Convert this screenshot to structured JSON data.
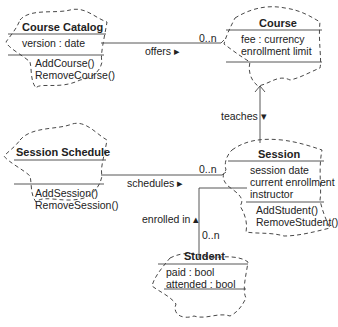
{
  "diagram": {
    "type": "UML class diagram",
    "classes": [
      {
        "name": "Course Catalog",
        "attributes": [
          "version : date"
        ],
        "operations": [
          "AddCourse()",
          "RemoveCourse()"
        ]
      },
      {
        "name": "Course",
        "attributes": [
          "fee : currency",
          "enrollment limit"
        ],
        "operations": []
      },
      {
        "name": "Session Schedule",
        "attributes": [],
        "operations": [
          "AddSession()",
          "RemoveSession()"
        ]
      },
      {
        "name": "Session",
        "attributes": [
          "session date",
          "current enrollment",
          "instructor"
        ],
        "operations": [
          "AddStudent()",
          "RemoveStudent()"
        ]
      },
      {
        "name": "Student",
        "attributes": [
          "paid : bool",
          "attended : bool"
        ],
        "operations": []
      }
    ],
    "associations": [
      {
        "from": "Course Catalog",
        "to": "Course",
        "label": "offers ▸",
        "multiplicity": "0..n"
      },
      {
        "from": "Session",
        "to": "Course",
        "label": "teaches ▾",
        "multiplicity": ""
      },
      {
        "from": "Session Schedule",
        "to": "Session",
        "label": "schedules ▸",
        "multiplicity": "0..n"
      },
      {
        "from": "Student",
        "to": "Session",
        "label": "enrolled in ▴",
        "multiplicity": "0..n"
      }
    ]
  }
}
